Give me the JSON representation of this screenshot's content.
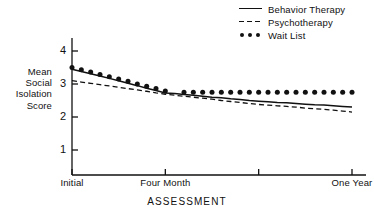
{
  "chart_data": {
    "type": "line",
    "title": "",
    "xlabel": "ASSESSMENT",
    "ylabel": "Mean Social Isolation Score",
    "ylabel_lines": [
      "Mean",
      "Social",
      "Isolation",
      "Score"
    ],
    "ylim": [
      0,
      4.6
    ],
    "yticks": [
      1,
      2,
      3,
      4
    ],
    "ytick_labels": [
      "1",
      "2",
      "3",
      "4"
    ],
    "grid": false,
    "legend_position": "top-right",
    "xlim": [
      0,
      3
    ],
    "xticks": [
      0,
      1,
      2,
      3
    ],
    "xtick_labels": [
      "Initial",
      "Four Month",
      "",
      "One Year"
    ],
    "x": [
      0,
      0.1,
      0.2,
      0.3,
      0.4,
      0.5,
      0.6,
      0.7,
      0.8,
      0.9,
      1.0,
      1.1,
      1.2,
      1.3,
      1.4,
      1.5,
      1.6,
      1.7,
      1.8,
      1.9,
      2.0,
      2.1,
      2.2,
      2.3,
      2.4,
      2.5,
      2.6,
      2.7,
      2.8,
      2.9,
      3.0
    ],
    "series": [
      {
        "name": "Behavior Therapy",
        "style": "solid",
        "values": [
          3.45,
          3.38,
          3.31,
          3.24,
          3.17,
          3.1,
          3.02,
          2.95,
          2.87,
          2.8,
          2.73,
          2.71,
          2.68,
          2.66,
          2.63,
          2.6,
          2.58,
          2.55,
          2.53,
          2.5,
          2.48,
          2.46,
          2.44,
          2.43,
          2.41,
          2.39,
          2.37,
          2.36,
          2.34,
          2.32,
          2.3
        ]
      },
      {
        "name": "Psychotherapy",
        "style": "dashed",
        "values": [
          3.1,
          3.06,
          3.02,
          2.98,
          2.94,
          2.9,
          2.86,
          2.82,
          2.78,
          2.73,
          2.69,
          2.66,
          2.63,
          2.6,
          2.57,
          2.54,
          2.5,
          2.47,
          2.44,
          2.41,
          2.38,
          2.36,
          2.34,
          2.32,
          2.3,
          2.27,
          2.25,
          2.23,
          2.21,
          2.18,
          2.15
        ]
      },
      {
        "name": "Wait List",
        "style": "dotted",
        "values": [
          3.5,
          3.43,
          3.36,
          3.29,
          3.22,
          3.15,
          3.08,
          3.0,
          2.93,
          2.86,
          2.79,
          null,
          2.75,
          2.75,
          2.75,
          2.75,
          2.75,
          2.75,
          2.75,
          2.75,
          2.75,
          2.75,
          2.75,
          2.75,
          2.75,
          2.75,
          2.75,
          2.75,
          2.75,
          2.75,
          2.75
        ]
      }
    ]
  },
  "legend": {
    "items": [
      {
        "label": "Behavior Therapy",
        "marker": "solid-line"
      },
      {
        "label": "Psychotherapy",
        "marker": "dashed-line"
      },
      {
        "label": "Wait List",
        "marker": "dots"
      }
    ]
  },
  "axes": {
    "y_title_lines": [
      "Mean",
      "Social",
      "Isolation",
      "Score"
    ],
    "y_tick_1": "1",
    "y_tick_2": "2",
    "y_tick_3": "3",
    "y_tick_4": "4",
    "x_tick_0": "Initial",
    "x_tick_1": "Four Month",
    "x_tick_3": "One Year",
    "x_title": "ASSESSMENT"
  },
  "colors": {
    "ink": "#111111",
    "background": "#ffffff"
  }
}
